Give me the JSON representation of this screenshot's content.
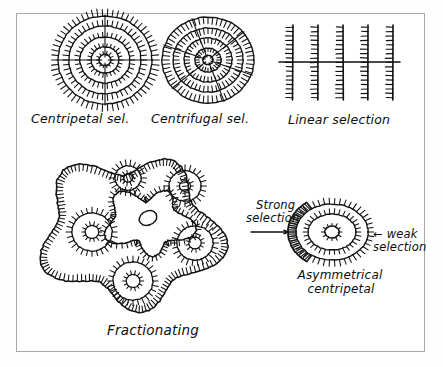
{
  "figure": {
    "background_color": "#ffffff",
    "ink_color": "#111111",
    "frame_color": "#a8a8a8"
  },
  "captions": {
    "centripetal": "Centripetal sel.",
    "centrifugal": "Centrifugal sel.",
    "linear": "Linear selection",
    "fractionating": "Fractionating",
    "strong_line1": "Strong",
    "strong_line2": "selection",
    "weak_line1": "← weak",
    "weak_line2": "selection",
    "asymmetrical_line1": "Asymmetrical",
    "asymmetrical_line2": "centripetal"
  },
  "chart_data": {
    "type": "diagram",
    "panels": [
      {
        "id": "centripetal",
        "label": "Centripetal sel.",
        "kind": "concentric-rings",
        "spike_direction": "outward",
        "center": [
          105,
          60
        ],
        "rings": [
          {
            "rx": 47,
            "ry": 44,
            "spikes": 62,
            "spike_len": 7
          },
          {
            "rx": 36,
            "ry": 34,
            "spikes": 50,
            "spike_len": 6
          },
          {
            "rx": 25,
            "ry": 23,
            "spikes": 38,
            "spike_len": 5
          },
          {
            "rx": 14,
            "ry": 13,
            "spikes": 26,
            "spike_len": 4
          },
          {
            "rx": 6,
            "ry": 5.5,
            "spikes": 14,
            "spike_len": 3
          }
        ],
        "radials": [
          0,
          90,
          180,
          270
        ]
      },
      {
        "id": "centrifugal",
        "label": "Centrifugal sel.",
        "kind": "concentric-rings",
        "spike_direction": "inward",
        "center": [
          208,
          60
        ],
        "rings": [
          {
            "rx": 46,
            "ry": 43,
            "spikes": 60,
            "spike_len": 7
          },
          {
            "rx": 35,
            "ry": 32,
            "spikes": 48,
            "spike_len": 6
          },
          {
            "rx": 24,
            "ry": 22,
            "spikes": 36,
            "spike_len": 5
          },
          {
            "rx": 13,
            "ry": 12,
            "spikes": 24,
            "spike_len": 4
          },
          {
            "rx": 5,
            "ry": 4.5,
            "spikes": 0,
            "spike_len": 0
          }
        ],
        "radials": [
          20,
          70,
          140,
          200,
          250,
          320
        ]
      },
      {
        "id": "linear",
        "label": "Linear selection",
        "kind": "linear-bars",
        "bars_x": [
          293,
          318,
          343,
          368,
          393
        ],
        "bar_top": 25,
        "bar_bottom": 100,
        "tick_len": 7,
        "tick_count": 17,
        "tick_side": "left",
        "crossbar": {
          "y": 62,
          "x1": 279,
          "x2": 400
        }
      },
      {
        "id": "fractionating",
        "label": "Fractionating",
        "kind": "lobed-blob",
        "outline_center": [
          130,
          232
        ],
        "outline_radius": 80,
        "spike_direction": "outward",
        "inner_circles": [
          {
            "cx": 128,
            "cy": 178,
            "r": 13,
            "spikes": 22
          },
          {
            "cx": 185,
            "cy": 186,
            "r": 16,
            "spikes": 24
          },
          {
            "cx": 92,
            "cy": 232,
            "r": 20,
            "spikes": 28
          },
          {
            "cx": 195,
            "cy": 243,
            "r": 18,
            "spikes": 26
          },
          {
            "cx": 133,
            "cy": 281,
            "r": 20,
            "spikes": 28
          }
        ],
        "core": {
          "cx": 148,
          "cy": 222,
          "r": 35,
          "spike_direction": "inward",
          "nucleus": {
            "cx": 148,
            "cy": 218,
            "rx": 9,
            "ry": 7,
            "rotation": -25
          }
        }
      },
      {
        "id": "asymmetrical",
        "label": "Asymmetrical centripetal",
        "kind": "asymmetric-oval",
        "center": [
          332,
          232
        ],
        "rings": [
          {
            "rx": 36,
            "ry": 28,
            "spikes": 46,
            "spike_len": 6
          },
          {
            "rx": 24,
            "ry": 18,
            "spikes": 34,
            "spike_len": 5
          },
          {
            "rx": 7,
            "ry": 6,
            "spikes": 12,
            "spike_len": 3
          }
        ],
        "strong_arc": {
          "cx": 332,
          "cy": 232,
          "r": 44,
          "start_deg": 125,
          "end_deg": 235,
          "spike_len": 8
        },
        "strong_arrow": {
          "x1": 251,
          "y1": 232,
          "x2": 288,
          "y2": 232,
          "direction": "right"
        },
        "weak_arrow": {
          "x1": 381,
          "y1": 232,
          "x2": 368,
          "y2": 232,
          "direction": "left"
        }
      }
    ],
    "annotations": [
      {
        "text": "Strong selection",
        "target": "asymmetrical",
        "side": "left"
      },
      {
        "text": "← weak selection",
        "target": "asymmetrical",
        "side": "right"
      }
    ]
  }
}
